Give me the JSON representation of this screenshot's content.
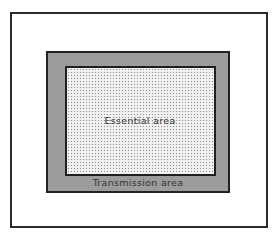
{
  "diagram": {
    "type": "nested-area-diagram",
    "regions": [
      {
        "id": "outer-frame",
        "label": ""
      },
      {
        "id": "transmission-area",
        "label": "Transmission area"
      },
      {
        "id": "essential-area",
        "label": "Essential area"
      }
    ]
  },
  "labels": {
    "essential": "Essential area",
    "transmission": "Transmission area"
  },
  "colors": {
    "border": "#222222",
    "transmission_fill": "#d4d4d4",
    "essential_fill": "#f0f0f0",
    "background": "#ffffff"
  }
}
